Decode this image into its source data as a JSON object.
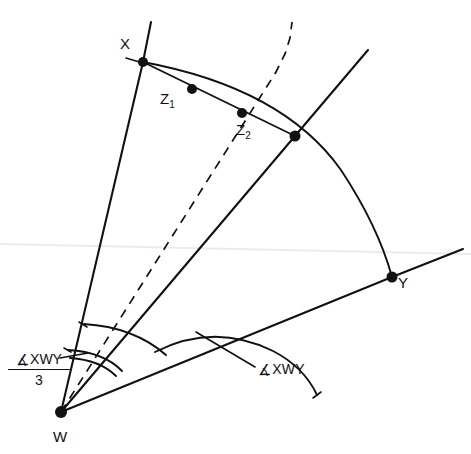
{
  "figure": {
    "type": "geometry-diagram",
    "background_color": "#ffffff",
    "ink_color": "#111111",
    "width": 471,
    "height": 454
  },
  "points": [
    {
      "id": "W",
      "label": "W",
      "x": 61,
      "y": 412,
      "role": "vertex"
    },
    {
      "id": "X",
      "label": "X",
      "x": 143,
      "y": 62,
      "role": "ray-endpoint"
    },
    {
      "id": "Y",
      "label": "Y",
      "x": 392,
      "y": 277,
      "role": "ray-endpoint"
    },
    {
      "id": "Z1",
      "label": "Z",
      "sub": "1",
      "x": 192,
      "y": 89,
      "role": "trisection-point"
    },
    {
      "id": "Z2",
      "label": "Z",
      "sub": "2",
      "x": 242,
      "y": 113,
      "role": "trisection-point"
    },
    {
      "id": "J",
      "label": "",
      "x": 295,
      "y": 136,
      "role": "junction"
    }
  ],
  "labels": {
    "point_x": "X",
    "point_y": "Y",
    "point_w": "W",
    "point_z1_base": "Z",
    "point_z1_sub": "1",
    "point_z2_base": "Z",
    "point_z2_sub": "2",
    "angle_symbol": "∡",
    "angle_xwy": "XWY",
    "fraction_numerator_symbol": "∡",
    "fraction_numerator_text": "XWY",
    "fraction_denominator": "3"
  },
  "annotations": {
    "whole_angle_label": "∡XWY",
    "third_angle_label": "∡XWY / 3"
  }
}
